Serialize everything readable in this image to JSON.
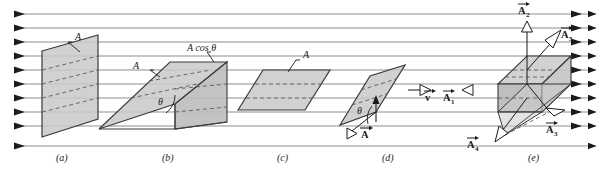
{
  "figure": {
    "background_color": "#ffffff",
    "field": {
      "description": "uniform horizontal field lines pointing right",
      "line_color": "#8e8e8e",
      "arrow_color": "#1b1b1b",
      "line_count": 10
    },
    "surface_fill": "#c9c9c9",
    "surface_stroke": "#3a3a3a",
    "dashed_color": "#5a5a5a"
  },
  "panels": [
    {
      "id": "a",
      "letter": "(a)",
      "labels": [
        {
          "name": "area-label",
          "text": "A"
        }
      ]
    },
    {
      "id": "b",
      "letter": "(b)",
      "labels": [
        {
          "name": "area-label",
          "text": "A"
        },
        {
          "name": "projected-area-label",
          "text": "A cos θ"
        },
        {
          "name": "angle-label",
          "text": "θ"
        }
      ]
    },
    {
      "id": "c",
      "letter": "(c)",
      "labels": [
        {
          "name": "area-label",
          "text": "A"
        }
      ]
    },
    {
      "id": "d",
      "letter": "(d)",
      "labels": [
        {
          "name": "angle-label",
          "text": "θ"
        },
        {
          "name": "area-vector-label",
          "text": "A",
          "subscript": ""
        },
        {
          "name": "velocity-vector-label",
          "text": "v",
          "subscript": ""
        },
        {
          "name": "area-vector-1-label",
          "text": "A",
          "subscript": "1"
        }
      ]
    },
    {
      "id": "e",
      "letter": "(e)",
      "labels": [
        {
          "name": "area-vector-2-label",
          "text": "A",
          "subscript": "2"
        },
        {
          "name": "area-vector-5-label",
          "text": "A",
          "subscript": "5"
        },
        {
          "name": "area-vector-3-label",
          "text": "A",
          "subscript": "3"
        },
        {
          "name": "area-vector-4-label",
          "text": "A",
          "subscript": "4"
        }
      ]
    }
  ],
  "text": {
    "A": "A",
    "A_cos_theta": "A cos θ",
    "theta": "θ",
    "v": "v",
    "sub1": "1",
    "sub2": "2",
    "sub3": "3",
    "sub4": "4",
    "sub5": "5",
    "letter_a": "(a)",
    "letter_b": "(b)",
    "letter_c": "(c)",
    "letter_d": "(d)",
    "letter_e": "(e)"
  }
}
